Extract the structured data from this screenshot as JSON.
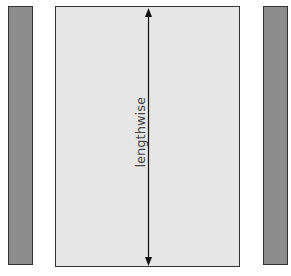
{
  "diagram": {
    "left_strip": {
      "color": "#8c8c8c",
      "x": 8,
      "y": 6,
      "width": 25,
      "height": 259
    },
    "panel": {
      "color": "#e6e6e6",
      "x": 55,
      "y": 6,
      "width": 185,
      "height": 260
    },
    "right_strip": {
      "color": "#8c8c8c",
      "x": 263,
      "y": 6,
      "width": 25,
      "height": 259
    },
    "arrow": {
      "x": 148,
      "y1": 9,
      "y2": 265,
      "direction": "bidirectional-vertical"
    },
    "label": "lengthwise"
  }
}
